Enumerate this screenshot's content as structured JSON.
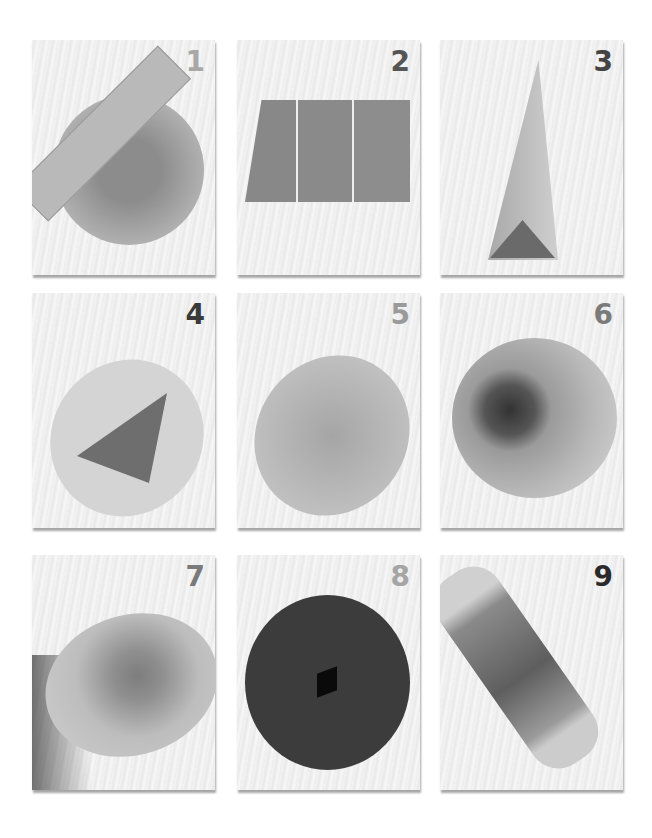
{
  "steps": [
    {
      "number": "1",
      "number_color": "#a8a8a8",
      "description": "Ruler measuring a circle of clear plastic"
    },
    {
      "number": "2",
      "number_color": "#555555",
      "description": "Sheet scored into three equal strips"
    },
    {
      "number": "3",
      "number_color": "#444444",
      "description": "Sheet folded into a triangular prism"
    },
    {
      "number": "4",
      "number_color": "#3a3a3a",
      "description": "Triangular prism inserted into tube"
    },
    {
      "number": "5",
      "number_color": "#9a9a9a",
      "description": "Clear plastic circle covering tube end"
    },
    {
      "number": "6",
      "number_color": "#7a7a7a",
      "description": "Sequins and glitter on plastic circle"
    },
    {
      "number": "7",
      "number_color": "#7a7a7a",
      "description": "Decorated end cap attached to tube"
    },
    {
      "number": "8",
      "number_color": "#a5a5a5",
      "description": "Dark circle with square peephole"
    },
    {
      "number": "9",
      "number_color": "#2a2a2a",
      "description": "Finished decorated kaleidoscope tube"
    }
  ]
}
